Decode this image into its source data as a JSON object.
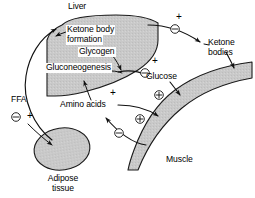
{
  "figure": {
    "kind": "metabolic-flow-diagram",
    "background_color": "#ffffff",
    "organ_fill_color": "#c9c9c9",
    "line_color": "#111111"
  },
  "organs": {
    "liver": {
      "label": "Liver"
    },
    "adipose": {
      "label_line1": "Adipose",
      "label_line2": "tissue"
    },
    "muscle": {
      "label": "Muscle"
    }
  },
  "liver_processes": [
    {
      "id": "ketone-body-formation",
      "line1": "Ketone body",
      "line2": "formation"
    },
    {
      "id": "glycogen",
      "line1": "Glycogen"
    },
    {
      "id": "gluconeogenesis",
      "line1": "Gluconeogenesis"
    }
  ],
  "metabolites": {
    "ffa": "FFA",
    "ketone_bodies_line1": "Ketone",
    "ketone_bodies_line2": "bodies",
    "glucose": "Glucose",
    "amino_acids": "Amino acids"
  },
  "signs": {
    "plus": "+",
    "minus_circled": "⊖",
    "plus_circled": "⊕"
  },
  "sign_markers": [
    {
      "id": "plus-ketone-efflux",
      "type": "plus",
      "x": 176,
      "y": 12
    },
    {
      "id": "minus-ketone-efflux",
      "type": "minus_circled",
      "x": 171,
      "y": 25
    },
    {
      "id": "plus-glucose-efflux",
      "type": "plus",
      "x": 152,
      "y": 56
    },
    {
      "id": "minus-glucose-efflux",
      "type": "minus_circled",
      "x": 141,
      "y": 69
    },
    {
      "id": "plus-amino-acid-influx",
      "type": "plus",
      "x": 110,
      "y": 90
    },
    {
      "id": "plus-circled-glucose-uptake",
      "type": "plus_circled",
      "x": 155,
      "y": 91
    },
    {
      "id": "plus-circled-amino-acid-release",
      "type": "plus_circled",
      "x": 136,
      "y": 115
    },
    {
      "id": "minus-circled-muscle-protein",
      "type": "minus_circled",
      "x": 115,
      "y": 130
    },
    {
      "id": "minus-circled-ffa",
      "type": "minus_circled",
      "x": 13,
      "y": 114
    },
    {
      "id": "plus-ffa",
      "type": "plus",
      "x": 29,
      "y": 112
    }
  ]
}
